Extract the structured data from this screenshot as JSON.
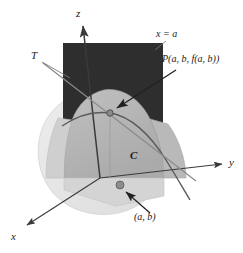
{
  "figure": {
    "labels": {
      "z_axis": "z",
      "y_axis": "y",
      "x_axis": "x",
      "tangent_line": "T",
      "curve": "C",
      "plane": "x = a",
      "point_on_surface": "P(a, b, f(a, b))",
      "point_in_plane": "(a, b)"
    },
    "colors": {
      "background": "#ffffff",
      "plane_dark": "#2e2e2e",
      "surface_mid": "#b5b5b5",
      "surface_light": "#e2e2e2",
      "surface_shadow": "#a8a8a8",
      "axis": "#3a3a3a",
      "curve": "#5a5a5a",
      "tangent": "#7a7a7a",
      "point_fill": "#8a8a8a",
      "point_stroke": "#4a4a4a",
      "label_text": "#1a1a1a"
    },
    "geometry": {
      "origin": [
        100,
        178
      ],
      "z_axis_tip": [
        82,
        22
      ],
      "y_axis_tip": [
        226,
        163
      ],
      "x_axis_tip": [
        23,
        228
      ],
      "point_P": [
        110,
        113
      ],
      "point_ab": [
        120,
        185
      ],
      "tangent_start": [
        43,
        63
      ],
      "tangent_end": [
        196,
        181
      ],
      "plane_rect": [
        63,
        43,
        163,
        178
      ]
    }
  }
}
